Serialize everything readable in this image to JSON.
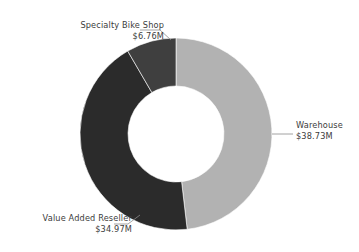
{
  "chart_data": {
    "type": "pie",
    "variant": "donut",
    "title": "",
    "subtitle": "",
    "xlabel": "",
    "ylabel": "",
    "grid": false,
    "legend_position": "none",
    "label_format": "$#.##M",
    "total": 80.46,
    "total_display": "$80.46M",
    "categories": [
      "Warehouse",
      "Value Added Reseller",
      "Specialty Bike Shop"
    ],
    "values": [
      38.73,
      34.97,
      6.76
    ],
    "value_labels": [
      "$38.73M",
      "$34.97M",
      "$6.76M"
    ],
    "percents": [
      48.1,
      43.5,
      8.4
    ],
    "colors": [
      "#b2b2b2",
      "#2b2b2b",
      "#3f3f3f"
    ],
    "slices": [
      {
        "name": "Warehouse",
        "value": 38.73,
        "value_label": "$38.73M",
        "percent": 48.1,
        "color": "#b2b2b2",
        "start_angle": 0,
        "end_angle": 173.3
      },
      {
        "name": "Value Added Reseller",
        "value": 34.97,
        "value_label": "$34.97M",
        "percent": 43.5,
        "color": "#2b2b2b",
        "start_angle": 173.3,
        "end_angle": 329.8
      },
      {
        "name": "Specialty Bike Shop",
        "value": 6.76,
        "value_label": "$6.76M",
        "percent": 8.4,
        "color": "#3f3f3f",
        "start_angle": 329.8,
        "end_angle": 360
      }
    ],
    "geometry": {
      "center_x": 176,
      "center_y": 134,
      "outer_radius": 96,
      "inner_radius": 48,
      "start_at_twelve_oclock": true,
      "direction": "clockwise"
    },
    "background_color": "#ffffff",
    "label_text_color": "#3c3c3c",
    "leader_line_color": "#8c8c8c"
  },
  "labels": {
    "specialty_bike_shop": {
      "name": "Specialty Bike Shop",
      "value": "$6.76M"
    },
    "warehouse": {
      "name": "Warehouse",
      "value": "$38.73M"
    },
    "value_added_reseller": {
      "name": "Value Added Reseller",
      "value": "$34.97M"
    }
  }
}
